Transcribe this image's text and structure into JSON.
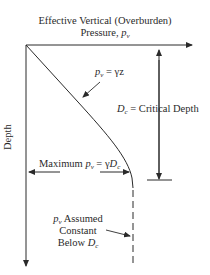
{
  "diagram": {
    "type": "geotechnical-pressure-depth-profile",
    "x_axis": {
      "title_line1": "Effective Vertical (Overburden)",
      "title_line2_prefix": "Pressure, ",
      "title_var": "p",
      "title_sub": "v"
    },
    "y_axis": {
      "label": "Depth"
    },
    "labels": {
      "linear_eq": {
        "var": "p",
        "sub": "v",
        "rhs": " = γz"
      },
      "critical_depth": {
        "var": "D",
        "sub": "c",
        "rhs": " = Critical Depth"
      },
      "maximum": {
        "prefix": "Maximum ",
        "var": "p",
        "sub": "v",
        "mid": " = γ",
        "var2": "D",
        "sub2": "c"
      },
      "constant_note": {
        "line1_var": "p",
        "line1_sub": "v",
        "line1_rest": " Assumed",
        "line2": "Constant",
        "line3_prefix": "Below ",
        "line3_var": "D",
        "line3_sub": "c"
      }
    },
    "colors": {
      "line": "#2a2a2a",
      "background": "#ffffff"
    }
  }
}
